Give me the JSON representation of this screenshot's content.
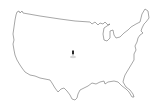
{
  "map": {
    "type": "outline",
    "region": "United States (contiguous)",
    "background_color": "#ffffff",
    "outline_color": "#6b6b6b",
    "marker": {
      "icon": "location-marker-icon",
      "color": "#2a2a2a",
      "x": 73,
      "y": 54
    }
  }
}
